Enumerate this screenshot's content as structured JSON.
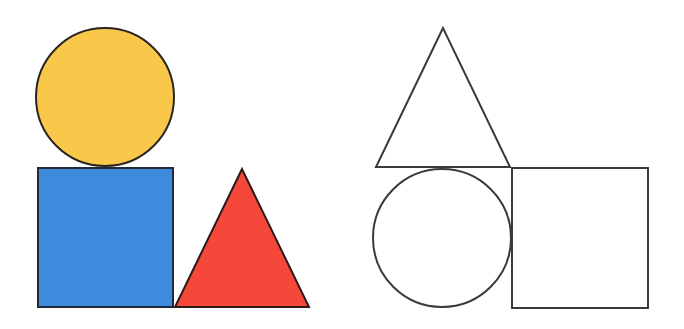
{
  "figure": {
    "width": 684,
    "height": 329,
    "background": "#ffffff",
    "panels": [
      {
        "name": "colored-arrangement",
        "shapes": [
          {
            "type": "circle",
            "label": "yellow circle",
            "cx": 105,
            "cy": 97,
            "r": 69,
            "fill": "#F9C84A",
            "stroke": "#2a2420",
            "stroke_width": 2
          },
          {
            "type": "square",
            "label": "blue square",
            "x": 38,
            "y": 168,
            "width": 135,
            "height": 139,
            "fill": "#3E8BDE",
            "stroke": "#1f2a3a",
            "stroke_width": 2
          },
          {
            "type": "triangle",
            "label": "red triangle",
            "points": [
              [
                242,
                169
              ],
              [
                175,
                307
              ],
              [
                309,
                307
              ]
            ],
            "fill": "#F6483A",
            "stroke": "#2a1a18",
            "stroke_width": 2
          }
        ]
      },
      {
        "name": "outline-arrangement",
        "shapes": [
          {
            "type": "triangle",
            "label": "outline triangle",
            "points": [
              [
                443,
                28
              ],
              [
                376,
                167
              ],
              [
                510,
                167
              ]
            ],
            "fill": "none",
            "stroke": "#3a3a3a",
            "stroke_width": 2
          },
          {
            "type": "circle",
            "label": "outline circle",
            "cx": 442,
            "cy": 238,
            "r": 69,
            "fill": "none",
            "stroke": "#3a3a3a",
            "stroke_width": 2
          },
          {
            "type": "square",
            "label": "outline square",
            "x": 512,
            "y": 168,
            "width": 136,
            "height": 140,
            "fill": "none",
            "stroke": "#3a3a3a",
            "stroke_width": 2
          }
        ]
      }
    ]
  }
}
